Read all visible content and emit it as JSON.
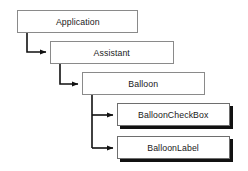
{
  "diagram": {
    "type": "hierarchy-tree",
    "background_color": "#ffffff",
    "border_color": "#8a8a8a",
    "shadow_color": "#111111",
    "text_color": "#1a1a1a",
    "nodes": [
      {
        "id": "application",
        "label": "Application",
        "x": 17,
        "y": 10,
        "width": 121,
        "height": 23,
        "style": "plain"
      },
      {
        "id": "assistant",
        "label": "Assistant",
        "x": 50,
        "y": 41,
        "width": 124,
        "height": 23,
        "style": "plain"
      },
      {
        "id": "balloon",
        "label": "Balloon",
        "x": 82,
        "y": 72,
        "width": 123,
        "height": 23,
        "style": "plain"
      },
      {
        "id": "balloon-check-box",
        "label": "BalloonCheckBox",
        "x": 117,
        "y": 103,
        "width": 113,
        "height": 23,
        "style": "shadowed"
      },
      {
        "id": "balloon-label",
        "label": "BalloonLabel",
        "x": 117,
        "y": 136,
        "width": 113,
        "height": 23,
        "style": "shadowed"
      }
    ],
    "connectors": [
      {
        "id": "application-to-assistant",
        "from": "application",
        "to": "assistant",
        "path": "M 27 33 L 27 52 L 47 52",
        "arrow_at": [
          50,
          52
        ],
        "arrow_direction": "right"
      },
      {
        "id": "assistant-to-balloon",
        "from": "assistant",
        "to": "balloon",
        "path": "M 60 64 L 60 84 L 79 84",
        "arrow_at": [
          82,
          84
        ],
        "arrow_direction": "right"
      },
      {
        "id": "balloon-to-balloon-check-box",
        "from": "balloon",
        "to": "balloon-check-box",
        "path": "M 92 95 L 92 115 L 114 115",
        "arrow_at": [
          117,
          115
        ],
        "arrow_direction": "right"
      },
      {
        "id": "balloon-to-balloon-label",
        "from": "balloon",
        "to": "balloon-label",
        "path": "M 92 115 L 92 148 L 114 148",
        "arrow_at": [
          117,
          148
        ],
        "arrow_direction": "right"
      }
    ]
  }
}
